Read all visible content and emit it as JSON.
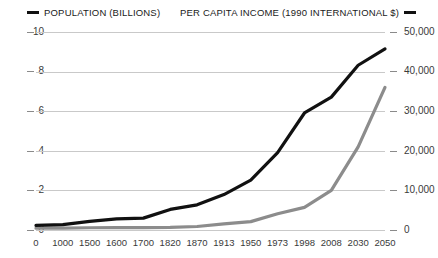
{
  "chart_data": {
    "type": "line",
    "title": "",
    "xlabel": "",
    "grid": true,
    "legend_position": "top",
    "categories": [
      "0",
      "1000",
      "1500",
      "1600",
      "1700",
      "1820",
      "1870",
      "1913",
      "1950",
      "1973",
      "1998",
      "2008",
      "2030",
      "2050"
    ],
    "series": [
      {
        "name": "POPULATION (BILLIONS)",
        "color": "#111111",
        "axis": "left",
        "ylabel": "POPULATION (BILLIONS)",
        "ylim": [
          0,
          10
        ],
        "yticks": [
          "0",
          "2",
          "4",
          "6",
          "8",
          "10"
        ],
        "values": [
          0.23,
          0.27,
          0.44,
          0.56,
          0.6,
          1.04,
          1.27,
          1.79,
          2.52,
          3.91,
          5.91,
          6.71,
          8.32,
          9.15
        ]
      },
      {
        "name": "PER CAPITA INCOME (1990 INTERNATIONAL $)",
        "color": "#8c8c8c",
        "axis": "right",
        "ylabel": "PER CAPITA INCOME (1990 INTERNATIONAL $)",
        "ylim": [
          0,
          50000
        ],
        "yticks": [
          "0",
          "10,000",
          "20,000",
          "30,000",
          "40,000",
          "50,000"
        ],
        "values": [
          460,
          450,
          570,
          600,
          620,
          670,
          880,
          1530,
          2110,
          4090,
          5710,
          10000,
          21000,
          36000
        ]
      }
    ]
  },
  "legend": {
    "entries": [
      {
        "label": "POPULATION (BILLIONS)",
        "color": "#111111",
        "marker": "line-swatch"
      },
      {
        "label": "PER CAPITA INCOME (1990 INTERNATIONAL $)",
        "color": "#111111",
        "marker": "line-swatch"
      }
    ]
  },
  "axes": {
    "left": {
      "ticks": [
        "10",
        "8",
        "6",
        "4",
        "2",
        "0"
      ]
    },
    "right": {
      "ticks": [
        "50,000",
        "40,000",
        "30,000",
        "20,000",
        "10,000",
        "0"
      ]
    },
    "bottom": {
      "ticks": [
        "0",
        "1000",
        "1500",
        "1600",
        "1700",
        "1820",
        "1870",
        "1913",
        "1950",
        "1973",
        "1998",
        "2008",
        "2030",
        "2050"
      ]
    }
  }
}
